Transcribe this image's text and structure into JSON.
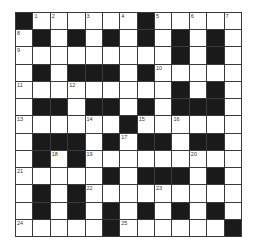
{
  "puzzle": {
    "type": "crossword",
    "size": 13,
    "grid": [
      "#......#.....",
      ".#.#.#.#.#.#.",
      ".........#.#.",
      ".#.###.#.....",
      ".........#.#.",
      ".##.##.#.###.",
      "......#......",
      ".###.#.##.##.",
      ".#.#.........",
      ".....#.###.#.",
      ".#.#.........",
      ".#.#.#.#.#.#.",
      ".....#......#"
    ],
    "numbers": [
      {
        "row": 0,
        "col": 1,
        "n": "1"
      },
      {
        "row": 0,
        "col": 2,
        "n": "2"
      },
      {
        "row": 0,
        "col": 4,
        "n": "3"
      },
      {
        "row": 0,
        "col": 6,
        "n": "4"
      },
      {
        "row": 0,
        "col": 8,
        "n": "5"
      },
      {
        "row": 0,
        "col": 10,
        "n": "6"
      },
      {
        "row": 0,
        "col": 12,
        "n": "7"
      },
      {
        "row": 1,
        "col": 0,
        "n": "8"
      },
      {
        "row": 2,
        "col": 0,
        "n": "9"
      },
      {
        "row": 3,
        "col": 8,
        "n": "10"
      },
      {
        "row": 4,
        "col": 0,
        "n": "11"
      },
      {
        "row": 4,
        "col": 3,
        "n": "12"
      },
      {
        "row": 6,
        "col": 0,
        "n": "13"
      },
      {
        "row": 6,
        "col": 4,
        "n": "14"
      },
      {
        "row": 6,
        "col": 7,
        "n": "15"
      },
      {
        "row": 6,
        "col": 9,
        "n": "16"
      },
      {
        "row": 7,
        "col": 6,
        "n": "17"
      },
      {
        "row": 8,
        "col": 2,
        "n": "18"
      },
      {
        "row": 8,
        "col": 4,
        "n": "19"
      },
      {
        "row": 8,
        "col": 10,
        "n": "20"
      },
      {
        "row": 9,
        "col": 0,
        "n": "21"
      },
      {
        "row": 10,
        "col": 4,
        "n": "22"
      },
      {
        "row": 10,
        "col": 8,
        "n": "23"
      },
      {
        "row": 12,
        "col": 0,
        "n": "24"
      },
      {
        "row": 12,
        "col": 6,
        "n": "25"
      }
    ]
  }
}
